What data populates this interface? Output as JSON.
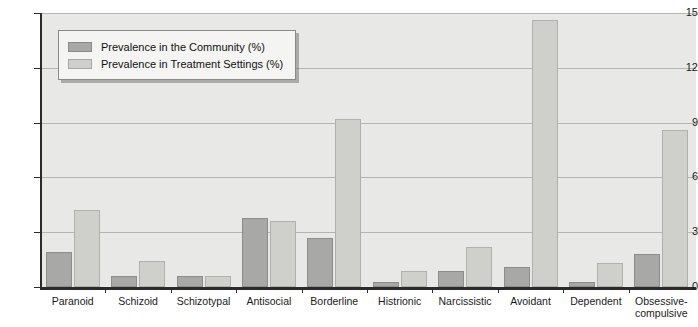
{
  "chart_data": {
    "type": "bar",
    "title": "",
    "xlabel": "",
    "ylabel": "",
    "ylim": [
      0,
      15
    ],
    "yticks": [
      "0",
      "3",
      "6",
      "9",
      "12",
      "15"
    ],
    "grid": true,
    "legend_position": "top-left",
    "categories": [
      "Paranoid",
      "Schizoid",
      "Schizotypal",
      "Antisocial",
      "Borderline",
      "Histrionic",
      "Narcissistic",
      "Avoidant",
      "Dependent",
      "Obsessive-compulsive"
    ],
    "series": [
      {
        "name": "Prevalence in the Community (%)",
        "color": "#a8a8a6",
        "values": [
          1.9,
          0.6,
          0.6,
          3.8,
          2.7,
          0.3,
          0.9,
          1.1,
          0.3,
          1.8
        ]
      },
      {
        "name": "Prevalence in Treatment Settings (%)",
        "color": "#cfcfcb",
        "values": [
          4.2,
          1.4,
          0.6,
          3.6,
          9.2,
          0.9,
          2.2,
          14.6,
          1.3,
          8.6
        ]
      }
    ]
  }
}
